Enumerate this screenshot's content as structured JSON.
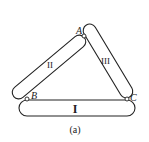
{
  "figure": {
    "caption": "(a)",
    "points": {
      "A": "A",
      "B": "B",
      "C": "C"
    },
    "bars": {
      "I": "I",
      "II": "II",
      "III": "III"
    },
    "colors": {
      "stroke": "#222222",
      "fill": "#ffffff"
    }
  }
}
